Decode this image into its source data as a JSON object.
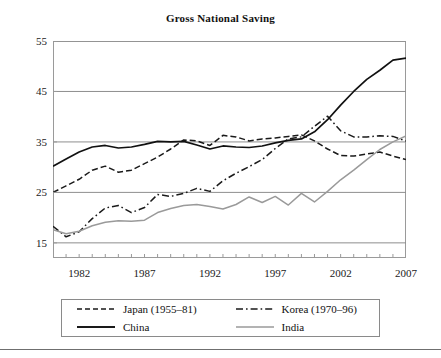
{
  "chart_data": {
    "type": "line",
    "title": "Gross National Saving",
    "xlabel": "",
    "ylabel": "",
    "xlim": [
      1980,
      2007
    ],
    "ylim": [
      12,
      55
    ],
    "grid": true,
    "grid_axis": "y",
    "legend_position": "below",
    "yticks": [
      15,
      25,
      35,
      45,
      55
    ],
    "xticks": [
      1982,
      1987,
      1992,
      1997,
      2002,
      2007
    ],
    "xticks_minor_every": 1,
    "x": [
      1980,
      1981,
      1982,
      1983,
      1984,
      1985,
      1986,
      1987,
      1988,
      1989,
      1990,
      1991,
      1992,
      1993,
      1994,
      1995,
      1996,
      1997,
      1998,
      1999,
      2000,
      2001,
      2002,
      2003,
      2004,
      2005,
      2006,
      2007
    ],
    "series": [
      {
        "name": "Japan (1955–81)",
        "style": "dashed",
        "color": "#1a1a1a",
        "values": [
          25.0,
          26.3,
          27.6,
          29.4,
          30.2,
          29.0,
          29.4,
          30.7,
          32.0,
          33.6,
          35.4,
          35.2,
          34.3,
          36.3,
          36.0,
          35.2,
          35.6,
          35.8,
          36.1,
          36.4,
          35.2,
          33.6,
          32.3,
          32.2,
          32.6,
          33.0,
          32.2,
          31.5
        ]
      },
      {
        "name": "Korea (1970–96)",
        "style": "dashdot",
        "color": "#1a1a1a",
        "values": [
          18.3,
          16.2,
          17.2,
          19.8,
          21.9,
          22.4,
          21.0,
          22.0,
          24.6,
          24.2,
          24.8,
          25.8,
          25.2,
          27.3,
          28.8,
          30.1,
          31.5,
          33.7,
          35.6,
          36.0,
          38.1,
          40.1,
          37.2,
          36.0,
          36.0,
          36.2,
          36.1,
          35.2
        ]
      },
      {
        "name": "China",
        "style": "solid",
        "color": "#111111",
        "values": [
          30.2,
          31.6,
          33.0,
          34.0,
          34.3,
          33.8,
          34.0,
          34.5,
          35.1,
          35.0,
          35.1,
          34.4,
          33.6,
          34.2,
          34.0,
          33.9,
          34.2,
          34.8,
          35.3,
          35.6,
          37.0,
          39.4,
          42.3,
          45.0,
          47.4,
          49.2,
          51.2,
          51.6
        ]
      },
      {
        "name": "India",
        "style": "solid",
        "color": "#9a9a9a",
        "values": [
          17.6,
          16.8,
          17.3,
          18.4,
          19.1,
          19.4,
          19.3,
          19.5,
          21.0,
          21.8,
          22.4,
          22.6,
          22.2,
          21.7,
          22.6,
          24.1,
          23.0,
          24.2,
          22.5,
          24.8,
          23.1,
          25.2,
          27.5,
          29.4,
          31.5,
          33.5,
          35.0,
          36.2
        ]
      }
    ]
  },
  "legend": {
    "entries": [
      {
        "label": "Japan (1955–81)",
        "style": "dashed"
      },
      {
        "label": "Korea (1970–96)",
        "style": "dashdot"
      },
      {
        "label": "China",
        "style": "solid"
      },
      {
        "label": "India",
        "style": "solid-gray"
      }
    ]
  },
  "colors": {
    "frame": "#9a9a9a",
    "grid": "#8e8e8e",
    "china": "#111111",
    "india": "#9a9a9a",
    "japan": "#1a1a1a",
    "korea": "#1a1a1a",
    "text": "#111111"
  }
}
